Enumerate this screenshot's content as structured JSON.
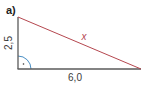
{
  "figure": {
    "part_label": "a)",
    "vertical_leg_label": "2,5",
    "base_label": "6,0",
    "hypotenuse_label": "x",
    "colors": {
      "legs": "#5a5a5a",
      "hypotenuse": "#b5474f",
      "right_angle_arc": "#4a8fc4",
      "text": "#3a3a3a"
    }
  }
}
